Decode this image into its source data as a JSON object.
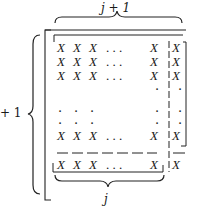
{
  "labels": {
    "top": "j + 1",
    "left": "+ 1",
    "bottom": "j"
  },
  "matrix": {
    "entry_symbol": "X",
    "ellipsis": ". . .",
    "vdot": "·",
    "rows": [
      {
        "left": [
          "X",
          "X",
          "X"
        ],
        "mid": ". . .",
        "last": "X",
        "col": "X"
      },
      {
        "left": [
          "X",
          "X",
          "X"
        ],
        "mid": ". . .",
        "last": "X",
        "col": "X"
      },
      {
        "left": [
          "X",
          "X",
          "X"
        ],
        "mid": ". . .",
        "last": "X",
        "col": "X"
      },
      {
        "left": [
          "X",
          "X",
          "X"
        ],
        "mid": ". . .",
        "last": "X",
        "col": "X"
      },
      {
        "left": [
          "X",
          "X",
          "X"
        ],
        "mid": ". . .",
        "last": "X",
        "col": "X"
      }
    ]
  }
}
